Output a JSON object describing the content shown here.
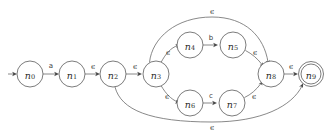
{
  "diagram": {
    "type": "finite-automaton",
    "epsilon_symbol": "ϵ",
    "start_state": "n0",
    "accept_states": [
      "n9"
    ],
    "colors": {
      "background": "#ffffff",
      "node_stroke": "#5a5a5a",
      "edge_stroke": "#6b6b6b",
      "label_text": "#2b2b2b"
    },
    "states": [
      {
        "id": "n0",
        "base": "n",
        "sub": "0",
        "cx": 30,
        "cy": 74,
        "r": 13,
        "accepting": false
      },
      {
        "id": "n1",
        "base": "n",
        "sub": "1",
        "cx": 72,
        "cy": 74,
        "r": 13,
        "accepting": false
      },
      {
        "id": "n2",
        "base": "n",
        "sub": "2",
        "cx": 113,
        "cy": 74,
        "r": 13,
        "accepting": false
      },
      {
        "id": "n3",
        "base": "n",
        "sub": "3",
        "cx": 156,
        "cy": 74,
        "r": 13,
        "accepting": false
      },
      {
        "id": "n4",
        "base": "n",
        "sub": "4",
        "cx": 190,
        "cy": 45,
        "r": 13,
        "accepting": false
      },
      {
        "id": "n5",
        "base": "n",
        "sub": "5",
        "cx": 233,
        "cy": 45,
        "r": 13,
        "accepting": false
      },
      {
        "id": "n6",
        "base": "n",
        "sub": "6",
        "cx": 190,
        "cy": 103,
        "r": 13,
        "accepting": false
      },
      {
        "id": "n7",
        "base": "n",
        "sub": "7",
        "cx": 232,
        "cy": 103,
        "r": 13,
        "accepting": false
      },
      {
        "id": "n8",
        "base": "n",
        "sub": "8",
        "cx": 271,
        "cy": 74,
        "r": 13,
        "accepting": false
      },
      {
        "id": "n9",
        "base": "n",
        "sub": "9",
        "cx": 311,
        "cy": 74,
        "r": 12,
        "accepting": true
      }
    ],
    "transitions": [
      {
        "from": "start",
        "to": "n0",
        "label": "",
        "label_x": 0,
        "label_y": 0
      },
      {
        "from": "n0",
        "to": "n1",
        "label": "a",
        "label_x": 51,
        "label_y": 66
      },
      {
        "from": "n1",
        "to": "n2",
        "label": "ϵ",
        "label_x": 93,
        "label_y": 66
      },
      {
        "from": "n2",
        "to": "n3",
        "label": "ϵ",
        "label_x": 135,
        "label_y": 66
      },
      {
        "from": "n3",
        "to": "n4",
        "label": "ϵ",
        "label_x": 168,
        "label_y": 52
      },
      {
        "from": "n4",
        "to": "n5",
        "label": "b",
        "label_x": 211,
        "label_y": 38
      },
      {
        "from": "n5",
        "to": "n8",
        "label": "ϵ",
        "label_x": 255,
        "label_y": 52
      },
      {
        "from": "n3",
        "to": "n6",
        "label": "ϵ",
        "label_x": 167,
        "label_y": 96
      },
      {
        "from": "n6",
        "to": "n7",
        "label": "c",
        "label_x": 211,
        "label_y": 96
      },
      {
        "from": "n7",
        "to": "n8",
        "label": "ϵ",
        "label_x": 254,
        "label_y": 96
      },
      {
        "from": "n8",
        "to": "n9",
        "label": "ϵ",
        "label_x": 291,
        "label_y": 66
      },
      {
        "from": "n3",
        "to": "n8",
        "label": "ϵ",
        "label_x": 212,
        "label_y": 11
      },
      {
        "from": "n2",
        "to": "n9",
        "label": "ϵ",
        "label_x": 212,
        "label_y": 127
      }
    ],
    "alphabet": [
      "a",
      "b",
      "c",
      "ϵ"
    ]
  }
}
